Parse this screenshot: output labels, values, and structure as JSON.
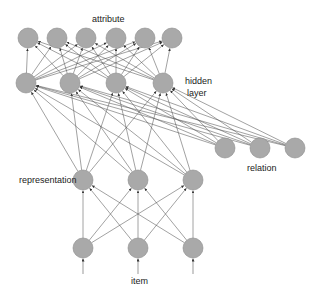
{
  "labels": {
    "attribute": "attribute",
    "hidden_line1": "hidden",
    "hidden_line2": "layer",
    "relation": "relation",
    "representation": "representation",
    "item": "item"
  },
  "colors": {
    "node_fill": "#a9a9a9",
    "node_stroke": "#8a8a8a",
    "edge": "#555555",
    "text": "#222222"
  },
  "layers": {
    "attribute": {
      "y": 38,
      "x": [
        28,
        57,
        86,
        116,
        145,
        172
      ]
    },
    "hidden": {
      "y": 83,
      "x": [
        26,
        70,
        116,
        163
      ]
    },
    "relation": {
      "y": 148,
      "x": [
        225,
        260,
        295
      ]
    },
    "representation": {
      "y": 180,
      "x": [
        83,
        138,
        193
      ]
    },
    "item": {
      "y": 248,
      "x": [
        83,
        138,
        193
      ]
    }
  },
  "node_radius": 10,
  "connections": [
    {
      "from": "item",
      "to": "representation",
      "type": "full"
    },
    {
      "from": "representation",
      "to": "hidden",
      "type": "full"
    },
    {
      "from": "relation",
      "to": "hidden",
      "type": "full"
    },
    {
      "from": "hidden",
      "to": "attribute",
      "type": "full"
    },
    {
      "from": "input",
      "to": "item",
      "type": "arrow-in"
    }
  ]
}
